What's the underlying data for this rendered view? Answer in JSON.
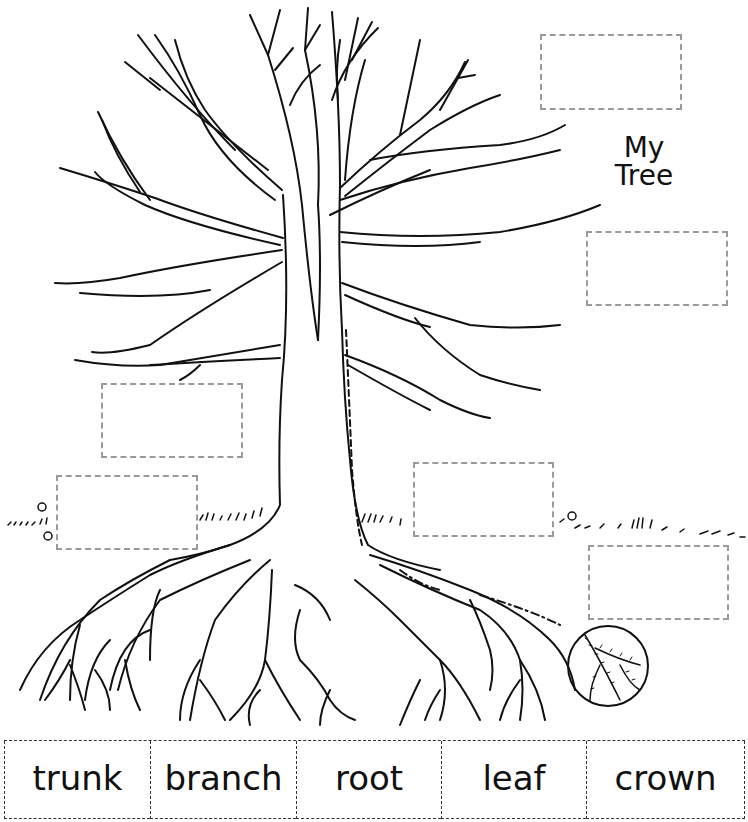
{
  "worksheet": {
    "title_line1": "My",
    "title_line2": "Tree",
    "label_boxes": [
      {
        "id": "box-top-right",
        "value": ""
      },
      {
        "id": "box-right-middle",
        "value": ""
      },
      {
        "id": "box-left-middle",
        "value": ""
      },
      {
        "id": "box-left-ground",
        "value": ""
      },
      {
        "id": "box-center-ground",
        "value": ""
      },
      {
        "id": "box-right-roots",
        "value": ""
      }
    ],
    "word_bank": [
      "trunk",
      "branch",
      "root",
      "leaf",
      "crown"
    ],
    "colors": {
      "line_art": "#111111",
      "box_border": "#9a9a9a",
      "bank_border": "#333333",
      "background": "#ffffff"
    }
  }
}
